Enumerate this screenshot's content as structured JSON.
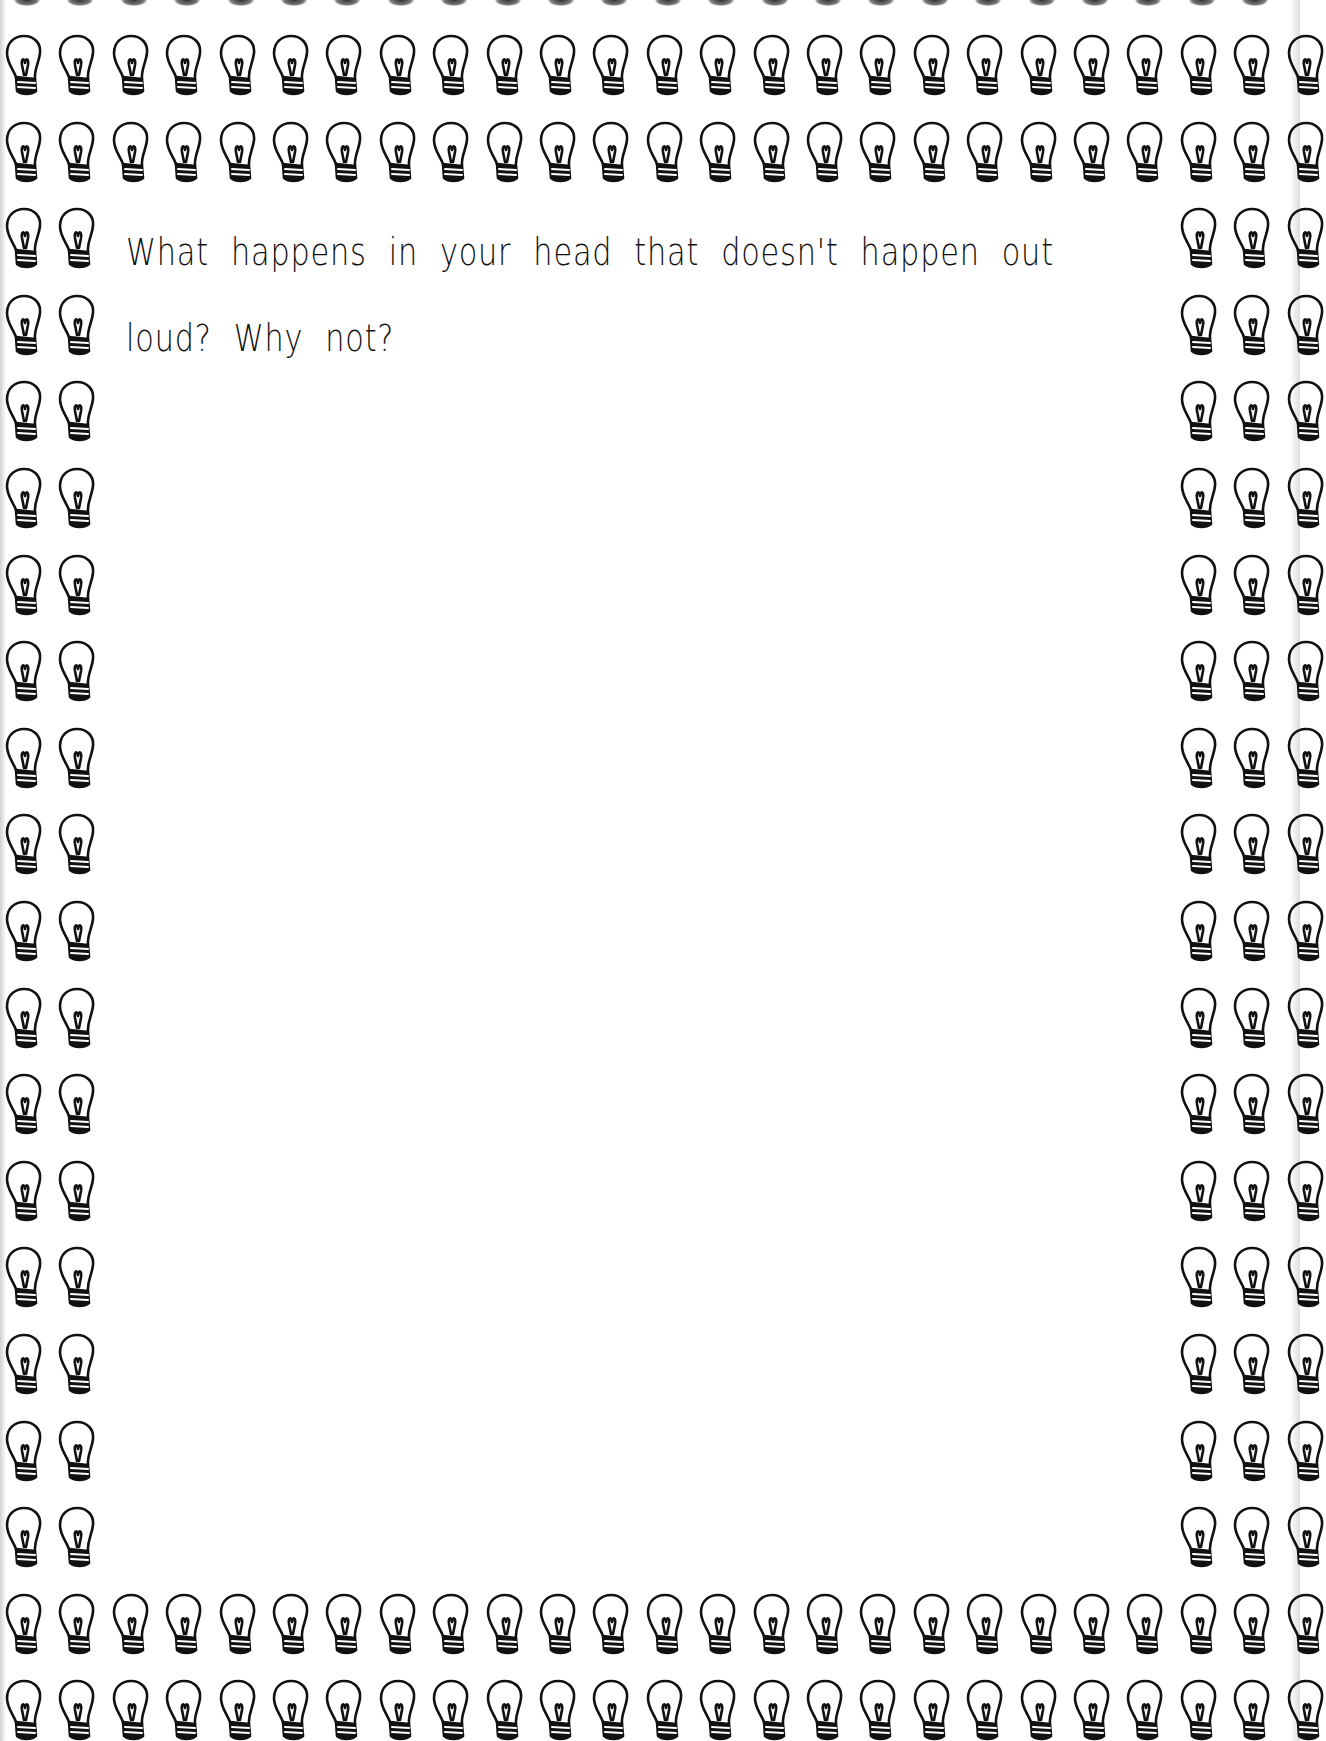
{
  "page": {
    "type": "journal-prompt-page",
    "prompt": {
      "line1": "What happens in your head that doesn't happen out",
      "line2": "loud? Why not?"
    },
    "border": {
      "icon": "lightbulb-icon",
      "color": "#111111",
      "background": "#ffffff"
    }
  }
}
